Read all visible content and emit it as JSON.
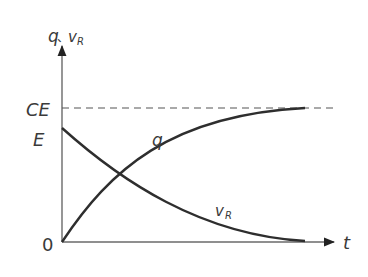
{
  "diagram": {
    "y_axis_label_q": "q",
    "y_axis_label_sep": "、",
    "y_axis_label_v": "v",
    "y_axis_label_v_sub": "R",
    "x_axis_label": "t",
    "origin_label": "0",
    "level_CE_label": "CE",
    "level_E_label": "E",
    "curve_q_label": "q",
    "curve_vR_label": "v",
    "curve_vR_label_sub": "R"
  },
  "colors": {
    "axis": "#6a6a6a",
    "curve": "#2e2e2e",
    "dashed": "#555555",
    "text": "#3a3a3a"
  }
}
